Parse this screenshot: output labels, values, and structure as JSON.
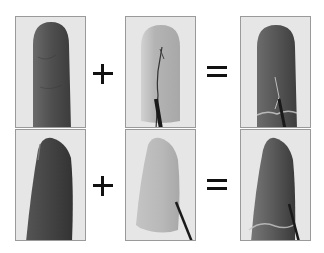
{
  "figure": {
    "rows": [
      {
        "view": "dorsal",
        "panels": [
          {
            "label": "bare-fingertip"
          },
          {
            "label": "sensor-skin-with-wire"
          },
          {
            "label": "fingertip-with-sensor"
          }
        ],
        "operators": [
          "+",
          "="
        ]
      },
      {
        "view": "lateral",
        "panels": [
          {
            "label": "bare-fingertip"
          },
          {
            "label": "sensor-skin-with-wire"
          },
          {
            "label": "fingertip-with-sensor"
          }
        ],
        "operators": [
          "+",
          "="
        ]
      }
    ]
  },
  "colors": {
    "background": "#ffffff",
    "panel_bg": "#e6e6e6",
    "panel_border": "#9a9a9a",
    "skin_dark": "#4a4a4a",
    "sensor_light": "#c8c8c8",
    "wire": "#1a1a1a",
    "operator": "#111111"
  }
}
